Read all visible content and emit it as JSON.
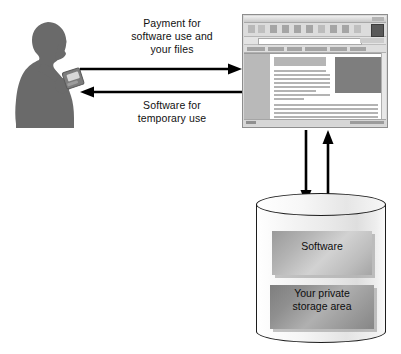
{
  "diagram": {
    "actor": {
      "name": "person-with-handheld-device",
      "description": "Silhouette of a person holding a handheld device"
    },
    "flows": [
      {
        "id": "payment",
        "label": "Payment for\nsoftware use and\nyour files",
        "direction": "user-to-server",
        "arrow": "right"
      },
      {
        "id": "software-temp",
        "label": "Software for\ntemporary use",
        "direction": "server-to-user",
        "arrow": "left"
      },
      {
        "id": "server-to-storage",
        "label": "",
        "direction": "server-to-storage",
        "arrow": "down"
      },
      {
        "id": "storage-to-server",
        "label": "",
        "direction": "storage-to-server",
        "arrow": "up"
      }
    ],
    "browser": {
      "name": "web-browser-window",
      "title": "",
      "address_value": "",
      "toolbar_icon_count": 9,
      "links_bar_item_count": 6
    },
    "storage": {
      "name": "storage-cylinder",
      "blocks": [
        {
          "id": "software",
          "label": "Software"
        },
        {
          "id": "private",
          "label": "Your private\nstorage area"
        }
      ]
    },
    "colors": {
      "background": "#ffffff",
      "silhouette": "#6a6a6a",
      "arrow": "#000000",
      "text": "#111111",
      "cylinder_outline": "#1d1d1d",
      "block_software": "#c2c2c2",
      "block_private": "#9a9a9a",
      "browser_chrome": "#d9d9d9"
    }
  }
}
